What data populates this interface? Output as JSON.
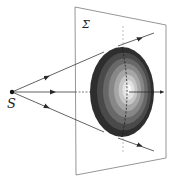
{
  "diagram": {
    "labels": {
      "source": "S",
      "plane": "Σ"
    },
    "colors": {
      "line": "#3a3a3a",
      "plane_edge": "#8a8a8a",
      "axis": "#b0b0b0",
      "source_dot": "#111111",
      "ellipsoid_bands": [
        "#2e2e2e",
        "#4a4a4a",
        "#686868",
        "#878787",
        "#a6a6a6",
        "#c6c6c6",
        "#e2e2e2",
        "#f6f6f6"
      ]
    },
    "geometry": {
      "source": {
        "x": 12,
        "y": 92
      },
      "plane": [
        [
          75,
          7
        ],
        [
          166,
          25
        ],
        [
          166,
          158
        ],
        [
          76,
          175
        ]
      ],
      "ellipsoid": {
        "cx": 122,
        "cy": 92,
        "rx": 32,
        "ry": 45
      },
      "rays": [
        {
          "name": "upper",
          "to": [
            154,
            33
          ]
        },
        {
          "name": "center",
          "to": [
            91,
            92
          ]
        },
        {
          "name": "lower",
          "to": [
            154,
            151
          ]
        }
      ],
      "outgoing_arrow": {
        "from": [
          136,
          92
        ],
        "to": [
          162,
          92
        ]
      }
    }
  }
}
